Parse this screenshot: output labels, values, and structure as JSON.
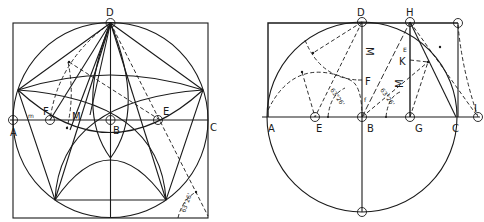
{
  "figure": {
    "left_diagram": {
      "title": "Pentagon and pentagram construction in a circle",
      "labels": {
        "D": "D",
        "A": "A",
        "B": "B",
        "C": "C",
        "E": "E",
        "F": "F",
        "M": "M",
        "m": "m",
        "angle": "63°26'"
      }
    },
    "right_diagram": {
      "title": "Golden section construction with circle",
      "labels": {
        "D": "D",
        "H": "H",
        "A": "A",
        "E": "E",
        "B": "B",
        "G": "G",
        "C": "C",
        "I": "I",
        "K": "K",
        "F": "F",
        "M_upper": "M",
        "M_lower": "M",
        "f": "f",
        "e": "E",
        "angle_left": "63°26'",
        "angle_right": "63°26'"
      }
    }
  },
  "colors": {
    "ink": "#1a1a1a",
    "background": "#ffffff"
  }
}
